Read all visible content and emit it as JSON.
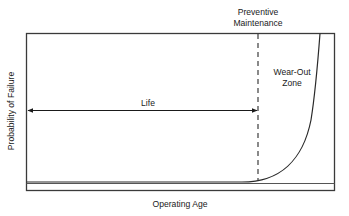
{
  "diagram": {
    "type": "bathtub-wearout-curve",
    "top_label_line1": "Preventive",
    "top_label_line2": "Maintenance",
    "zone_label_line1": "Wear-Out",
    "zone_label_line2": "Zone",
    "life_label": "Life",
    "x_axis_label": "Operating Age",
    "y_axis_label": "Probability of Failure",
    "colors": {
      "stroke": "#3a3a3a",
      "text": "#1a1a1a",
      "background": "#ffffff"
    }
  }
}
